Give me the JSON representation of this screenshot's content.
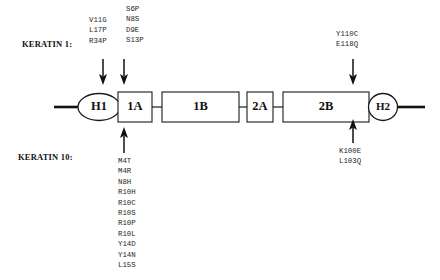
{
  "rows": {
    "keratin1_label": "KERATIN 1:",
    "keratin10_label": "KERATIN 10:"
  },
  "mutations": {
    "k1_v_column": [
      "V11G",
      "L17P",
      "R34P"
    ],
    "k1_s_column": [
      "S6P",
      "N8S",
      "D9E",
      "S13P"
    ],
    "k1_2b_column": [
      "Y110C",
      "E118Q"
    ],
    "k10_1a_column": [
      "M4T",
      "M4R",
      "N8H",
      "R10H",
      "R10C",
      "R10S",
      "R10P",
      "R10L",
      "Y14D",
      "Y14N",
      "L15S"
    ],
    "k10_2b_column": [
      "K100E",
      "L103Q"
    ]
  },
  "domains": {
    "h1": "H1",
    "1a": "1A",
    "1b": "1B",
    "2a": "2A",
    "2b": "2B",
    "h2": "H2"
  },
  "colors": {
    "stroke": "#1a1a1a",
    "fill": "#ffffff",
    "text": "#111111",
    "background": "#ffffff"
  }
}
